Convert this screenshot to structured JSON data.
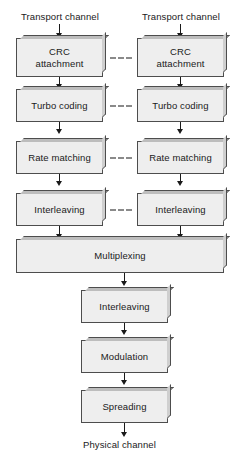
{
  "diagram": {
    "colors": {
      "box_fill": "#eeeeee",
      "box_border": "#4d4d4d",
      "bevel_top": "#bdbdbd",
      "bevel_right": "#cfcfcf",
      "arrow": "#1a1a1a",
      "dash": "#8a8a8a",
      "text": "#1a1a1a",
      "background": "#ffffff"
    },
    "endpoints": {
      "input_left": "Transport channel",
      "input_right": "Transport channel",
      "output": "Physical channel"
    },
    "columns": {
      "left": {
        "name": "left-transport-channel-chain",
        "stages": [
          {
            "id": "crc-attachment",
            "label": "CRC\nattachment",
            "line1": "CRC",
            "line2": "attachment"
          },
          {
            "id": "turbo-coding",
            "label": "Turbo coding",
            "line1": "Turbo coding",
            "line2": ""
          },
          {
            "id": "rate-matching",
            "label": "Rate matching",
            "line1": "Rate matching",
            "line2": ""
          },
          {
            "id": "interleaving",
            "label": "Interleaving",
            "line1": "Interleaving",
            "line2": ""
          }
        ]
      },
      "right": {
        "name": "right-transport-channel-chain",
        "stages": [
          {
            "id": "crc-attachment",
            "label": "CRC\nattachment",
            "line1": "CRC",
            "line2": "attachment"
          },
          {
            "id": "turbo-coding",
            "label": "Turbo coding",
            "line1": "Turbo coding",
            "line2": ""
          },
          {
            "id": "rate-matching",
            "label": "Rate matching",
            "line1": "Rate matching",
            "line2": ""
          },
          {
            "id": "interleaving",
            "label": "Interleaving",
            "line1": "Interleaving",
            "line2": ""
          }
        ]
      }
    },
    "shared_stages": [
      {
        "id": "multiplexing",
        "label": "Multiplexing"
      },
      {
        "id": "interleaving-2",
        "label": "Interleaving"
      },
      {
        "id": "modulation",
        "label": "Modulation"
      },
      {
        "id": "spreading",
        "label": "Spreading"
      }
    ],
    "ellipsis_connectors": {
      "count": 4,
      "dashes_per_connector": 3,
      "meaning": "additional parallel transport channels omitted"
    }
  }
}
